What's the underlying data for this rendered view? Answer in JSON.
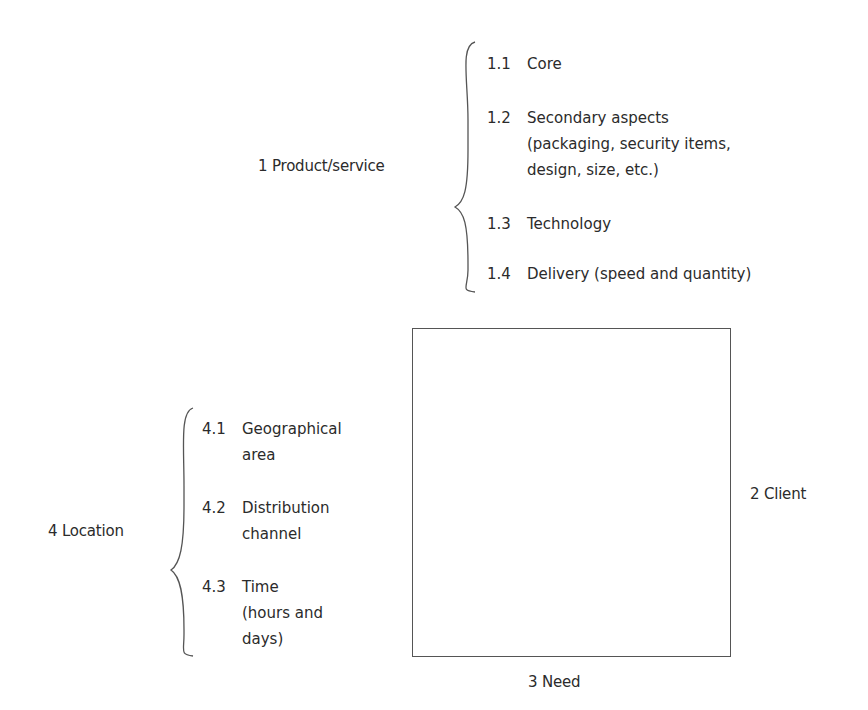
{
  "diagram": {
    "dimensions": [
      {
        "label": "1 Product/service",
        "items": [
          {
            "num": "1.1",
            "lines": [
              "Core"
            ]
          },
          {
            "num": "1.2",
            "lines": [
              "Secondary aspects",
              "(packaging, security items,",
              "design, size, etc.)"
            ]
          },
          {
            "num": "1.3",
            "lines": [
              "Technology"
            ]
          },
          {
            "num": "1.4",
            "lines": [
              "Delivery (speed and quantity)"
            ]
          }
        ]
      },
      {
        "label": "2  Client"
      },
      {
        "label": "3  Need"
      },
      {
        "label": "4  Location",
        "items": [
          {
            "num": "4.1",
            "lines": [
              "Geographical",
              "area"
            ]
          },
          {
            "num": "4.2",
            "lines": [
              "Distribution",
              "channel"
            ]
          },
          {
            "num": "4.3",
            "lines": [
              "Time",
              "(hours and",
              "days)"
            ]
          }
        ]
      }
    ]
  }
}
